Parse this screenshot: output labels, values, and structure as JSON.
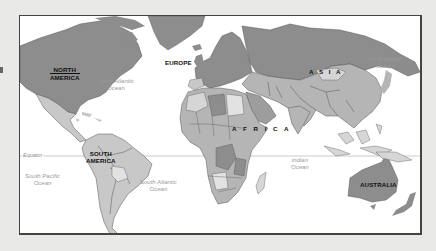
{
  "map": {
    "title": "World map",
    "continents": [
      {
        "id": "north_america",
        "label": "NORTH AMERICA",
        "line1": "NORTH",
        "line2": "AMERICA"
      },
      {
        "id": "south_america",
        "label": "SOUTH AMERICA",
        "line1": "SOUTH",
        "line2": "AMERICA"
      },
      {
        "id": "europe",
        "label": "EUROPE"
      },
      {
        "id": "asia",
        "label": "A S I A"
      },
      {
        "id": "africa",
        "label": "A F R I C A"
      },
      {
        "id": "australia",
        "label": "AUSTRALIA"
      }
    ],
    "oceans": [
      {
        "id": "north_atlantic",
        "line1": "North Atlantic",
        "line2": "Ocean"
      },
      {
        "id": "north_pacific",
        "line1": "North Pacific",
        "line2": "Ocean"
      },
      {
        "id": "south_pacific",
        "line1": "South Pacific",
        "line2": "Ocean"
      },
      {
        "id": "south_atlantic",
        "line1": "South Atlantic",
        "line2": "Ocean"
      },
      {
        "id": "indian",
        "line1": "Indian",
        "line2": "Ocean"
      }
    ],
    "equator_label": "Equator",
    "colors": {
      "dark_land": "#8d8d8d",
      "mid_land": "#b5b5b5",
      "light_land": "#d6d6d6",
      "border": "#4a4a4a",
      "ocean": "#ffffff",
      "background": "#e9e9e7"
    }
  }
}
